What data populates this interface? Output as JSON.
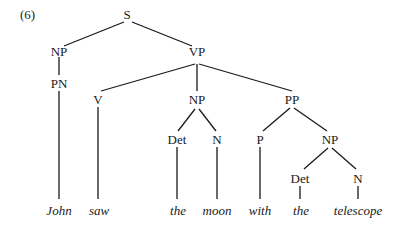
{
  "example_number": "(6)",
  "tree": {
    "nodes": {
      "S": "S",
      "NP_subj": "NP",
      "PN": "PN",
      "VP": "VP",
      "V": "V",
      "NP_obj": "NP",
      "Det_obj": "Det",
      "N_obj": "N",
      "PP": "PP",
      "P": "P",
      "NP_pp": "NP",
      "Det_pp": "Det",
      "N_pp": "N"
    },
    "words": {
      "w1": "John",
      "w2": "saw",
      "w3": "the",
      "w4": "moon",
      "w5": "with",
      "w6": "the",
      "w7": "telescope"
    }
  },
  "colors": {
    "ink": "#1a1a1a",
    "background": "#ffffff"
  }
}
